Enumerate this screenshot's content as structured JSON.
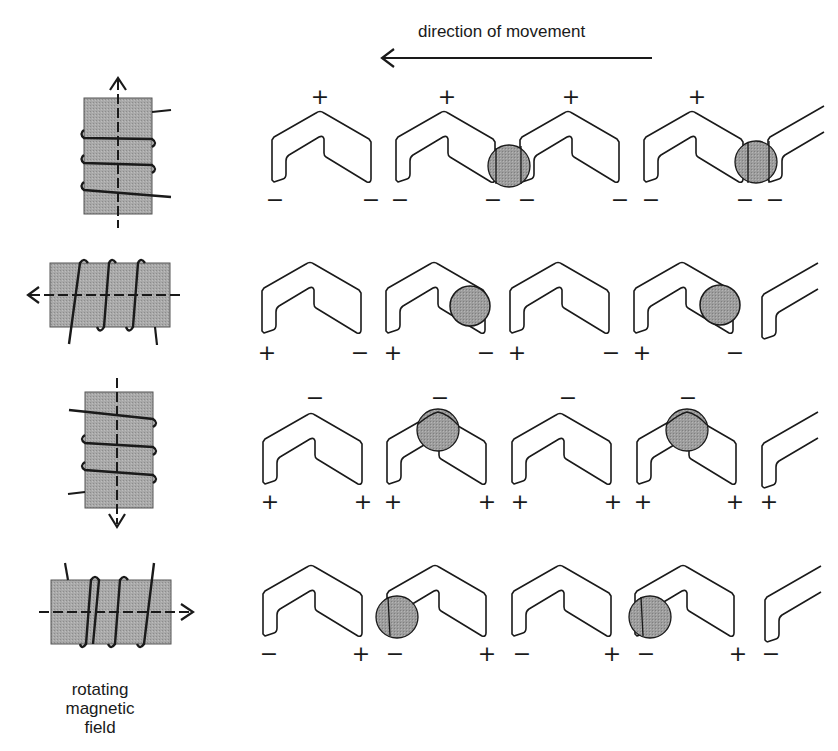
{
  "title_arrow": {
    "label": "direction of movement",
    "direction": "left"
  },
  "caption": {
    "line1": "rotating",
    "line2": "magnetic",
    "line3": "field"
  },
  "colors": {
    "core_fill": "#a8a8a8",
    "bubble_fill": "#9a9a9a",
    "line": "#1a1a1a",
    "background": "#ffffff"
  },
  "rows": [
    {
      "field_direction": "up",
      "coil_orientation": "vertical",
      "signs": {
        "top": "+",
        "left": "−",
        "right": "−"
      },
      "bubble_positions": [
        "between chevron 2 and 3 (right bottom)",
        "between chevron 4 and 5 (right bottom)"
      ]
    },
    {
      "field_direction": "left",
      "coil_orientation": "horizontal",
      "signs": {
        "top": "",
        "left": "+",
        "right": "−"
      },
      "bubble_positions": [
        "chevron 2 right arm",
        "chevron 4 right arm"
      ]
    },
    {
      "field_direction": "down",
      "coil_orientation": "vertical",
      "signs": {
        "top": "−",
        "left": "+",
        "right": "+"
      },
      "bubble_positions": [
        "chevron 2 apex",
        "chevron 4 apex"
      ]
    },
    {
      "field_direction": "right",
      "coil_orientation": "horizontal",
      "signs": {
        "top": "",
        "left": "−",
        "right": "+"
      },
      "bubble_positions": [
        "chevron 2 left bottom",
        "chevron 4 left bottom"
      ]
    }
  ],
  "sign_labels": {
    "row1": [
      "+",
      "−",
      "−",
      "+",
      "−",
      "−",
      "+",
      "−",
      "−",
      "+",
      "−",
      "−",
      "−"
    ],
    "row2": [
      "+",
      "−",
      "+",
      "−",
      "+",
      "−",
      "+",
      "−"
    ],
    "row3": [
      "−",
      "+",
      "+",
      "−",
      "+",
      "+",
      "−",
      "+",
      "+",
      "−",
      "+",
      "+",
      "+"
    ],
    "row4": [
      "−",
      "+",
      "−",
      "+",
      "−",
      "+",
      "−",
      "+",
      "−"
    ]
  }
}
